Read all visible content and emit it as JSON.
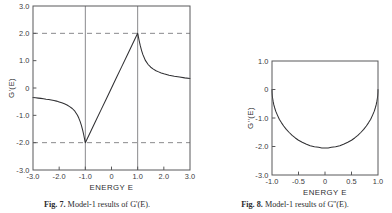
{
  "figure": {
    "background": "#ffffff",
    "ink": "#303033",
    "grid_color": "#8a8a8d",
    "frame_color": "#58585a"
  },
  "panels": [
    {
      "id": "left",
      "caption_label": "Fig. 7.",
      "caption_text": "Model-1 results of G'(E).",
      "chart_data": {
        "type": "line",
        "title": "",
        "xlabel": "ENERGY E",
        "ylabel": "G'(E)",
        "xlim": [
          -3.0,
          3.0
        ],
        "ylim": [
          -3.0,
          3.0
        ],
        "grid": true,
        "legend": "none",
        "xticks": [
          -3.0,
          -2.0,
          -1.0,
          0,
          1.0,
          2.0,
          3.0
        ],
        "xticklabels": [
          "-3.0",
          "-2.0",
          "-1.0",
          "0",
          "1.0",
          "2.0",
          "3.0"
        ],
        "yticks": [
          3.0,
          2.0,
          1.0,
          0,
          -1.0,
          -2.0,
          -3.0
        ],
        "yticklabels": [
          "3.0",
          "2.0",
          "1.0",
          "0",
          "-1.0",
          "-2.0",
          "-3.0"
        ],
        "vlines_solid": [
          -1.0,
          1.0
        ],
        "hlines_dashed": [
          2.0,
          -2.0
        ],
        "annotations": [
          "cusp minimum reaching -2.0 at E = -1.0",
          "peak reaching +2.0 at E = +1.0",
          "linear rise between E = -1.0 and E = +1.0"
        ],
        "series": [
          {
            "name": "G'(E)",
            "x": [
              -3.0,
              -2.9,
              -2.8,
              -2.7,
              -2.6,
              -2.5,
              -2.4,
              -2.3,
              -2.2,
              -2.1,
              -2.0,
              -1.9,
              -1.8,
              -1.7,
              -1.6,
              -1.5,
              -1.4,
              -1.3,
              -1.25,
              -1.2,
              -1.15,
              -1.1,
              -1.06,
              -1.03,
              -1.01,
              -1.0,
              -0.95,
              -0.8,
              -0.6,
              -0.4,
              -0.2,
              0.0,
              0.2,
              0.4,
              0.6,
              0.8,
              0.95,
              1.0,
              1.01,
              1.03,
              1.06,
              1.1,
              1.15,
              1.2,
              1.3,
              1.4,
              1.5,
              1.6,
              1.7,
              1.8,
              1.9,
              2.0,
              2.2,
              2.4,
              2.6,
              2.8,
              3.0
            ],
            "y": [
              -0.35,
              -0.36,
              -0.37,
              -0.38,
              -0.39,
              -0.41,
              -0.42,
              -0.44,
              -0.46,
              -0.48,
              -0.51,
              -0.54,
              -0.58,
              -0.62,
              -0.68,
              -0.75,
              -0.85,
              -1.0,
              -1.1,
              -1.22,
              -1.37,
              -1.55,
              -1.72,
              -1.86,
              -1.96,
              -2.0,
              -1.9,
              -1.6,
              -1.2,
              -0.8,
              -0.4,
              0.0,
              0.4,
              0.8,
              1.2,
              1.6,
              1.9,
              2.0,
              1.96,
              1.86,
              1.72,
              1.55,
              1.37,
              1.22,
              1.0,
              0.86,
              0.76,
              0.69,
              0.63,
              0.59,
              0.55,
              0.52,
              0.47,
              0.43,
              0.4,
              0.37,
              0.35
            ]
          }
        ]
      }
    },
    {
      "id": "right",
      "caption_label": "Fig. 8.",
      "caption_text": "Model-1 results of G''(E).",
      "chart_data": {
        "type": "line",
        "title": "",
        "xlabel": "ENERGY E",
        "ylabel": "G''(E)",
        "xlim": [
          -1.0,
          1.0
        ],
        "ylim": [
          -3.0,
          1.0
        ],
        "grid": false,
        "legend": "none",
        "xticks": [
          -1.0,
          -0.5,
          0,
          0.5,
          1.0
        ],
        "xticklabels": [
          "-1.0",
          "-0.5",
          "0",
          "0.5",
          "1.0"
        ],
        "yticks": [
          1.0,
          0,
          -1.0,
          -2.0,
          -3.0
        ],
        "yticklabels": [
          "1.0",
          "0",
          "-1.0",
          "-2.0",
          "-3.0"
        ],
        "vlines_solid": [],
        "hlines_dashed": [],
        "annotations": [
          "semi-elliptical band from E = -1.0 to E = +1.0",
          "minimum about -2.05 at E = 0",
          "rises steeply to 0 at both band edges"
        ],
        "series": [
          {
            "name": "G''(E)",
            "x": [
              -1.0,
              -0.999,
              -0.995,
              -0.99,
              -0.98,
              -0.965,
              -0.95,
              -0.93,
              -0.9,
              -0.86,
              -0.82,
              -0.78,
              -0.73,
              -0.68,
              -0.62,
              -0.56,
              -0.5,
              -0.43,
              -0.36,
              -0.28,
              -0.2,
              -0.12,
              -0.06,
              0.0,
              0.06,
              0.12,
              0.2,
              0.28,
              0.36,
              0.43,
              0.5,
              0.56,
              0.62,
              0.68,
              0.73,
              0.78,
              0.82,
              0.86,
              0.9,
              0.93,
              0.95,
              0.965,
              0.98,
              0.99,
              0.995,
              0.999,
              1.0
            ],
            "y": [
              0.0,
              -0.09,
              -0.2,
              -0.29,
              -0.41,
              -0.54,
              -0.64,
              -0.76,
              -0.89,
              -1.05,
              -1.17,
              -1.28,
              -1.4,
              -1.5,
              -1.61,
              -1.7,
              -1.78,
              -1.85,
              -1.91,
              -1.97,
              -2.01,
              -2.03,
              -2.05,
              -2.05,
              -2.05,
              -2.03,
              -2.01,
              -1.97,
              -1.91,
              -1.85,
              -1.78,
              -1.7,
              -1.61,
              -1.5,
              -1.4,
              -1.28,
              -1.17,
              -1.05,
              -0.89,
              -0.76,
              -0.64,
              -0.54,
              -0.41,
              -0.29,
              -0.2,
              -0.09,
              0.0
            ]
          }
        ]
      }
    }
  ]
}
